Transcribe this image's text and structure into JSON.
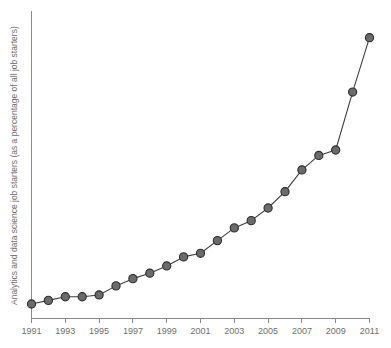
{
  "chart_data": {
    "type": "line",
    "title": "",
    "subtitle": "",
    "xlabel": "",
    "ylabel": "Analytics and data science job starters (as a percentage of all job starters)",
    "legend": [],
    "legend_position": "none",
    "grid": false,
    "x": [
      1991,
      1992,
      1993,
      1994,
      1995,
      1996,
      1997,
      1998,
      1999,
      2000,
      2001,
      2002,
      2003,
      2004,
      2005,
      2006,
      2007,
      2008,
      2009,
      2010,
      2011
    ],
    "values": [
      0.8,
      1.0,
      1.2,
      1.2,
      1.3,
      1.8,
      2.2,
      2.5,
      2.9,
      3.4,
      3.6,
      4.3,
      5.0,
      5.4,
      6.1,
      7.0,
      8.2,
      9.0,
      9.3,
      12.5,
      15.5
    ],
    "xlim": [
      1991,
      2011
    ],
    "ylim": [
      0,
      17
    ],
    "x_tick_labels": [
      "1991",
      "1993",
      "1995",
      "1997",
      "1999",
      "2001",
      "2003",
      "2005",
      "2007",
      "2009",
      "2011"
    ],
    "x_ticks": [
      1991,
      1993,
      1995,
      1997,
      1999,
      2001,
      2003,
      2005,
      2007,
      2009,
      2011
    ],
    "y_tick_labels": [],
    "y_ticks": [],
    "marker": "circle",
    "marker_fill_color": "#6b6b6b",
    "marker_edge_color": "#2e2e2e",
    "line_color": "#3f3f3f",
    "axis_color": "#8a8a8a",
    "label_color": "#6e6e6e",
    "background_color": "#ffffff",
    "annotations": []
  }
}
